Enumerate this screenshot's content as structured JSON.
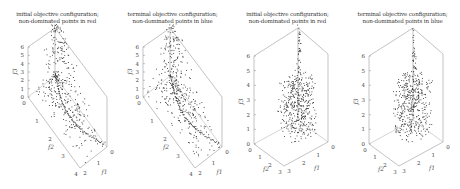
{
  "figure": {
    "panels": [
      {
        "title_line1": "initial objective configuration;",
        "title_line2": "non-dominated points in red",
        "shape": "cone",
        "xlim": [
          0,
          4
        ],
        "ylim": [
          0,
          2
        ],
        "zlim": [
          0,
          6
        ]
      },
      {
        "title_line1": "terminal objective configuration;",
        "title_line2": "non-dominated points in blue",
        "shape": "cone",
        "xlim": [
          0,
          4
        ],
        "ylim": [
          0,
          2
        ],
        "zlim": [
          0,
          6
        ]
      },
      {
        "title_line1": "initial objective configuration;",
        "title_line2": "non-dominated points in red",
        "shape": "block",
        "xlim": [
          0,
          3
        ],
        "ylim": [
          0,
          3
        ],
        "zlim": [
          0,
          6
        ]
      },
      {
        "title_line1": "terminal objective configuration;",
        "title_line2": "non-dominated points in blue",
        "shape": "block",
        "xlim": [
          0,
          3
        ],
        "ylim": [
          0,
          3
        ],
        "zlim": [
          0,
          6
        ]
      }
    ]
  },
  "chart_data": [
    {
      "type": "scatter",
      "title": "initial objective configuration; non-dominated points in red",
      "xlabel": "f2",
      "ylabel": "f1",
      "zlabel": "f3",
      "x_ticks": [
        "0",
        "1",
        "2",
        "3",
        "4"
      ],
      "y_ticks": [
        "0",
        "1",
        "2"
      ],
      "z_ticks": [
        "0",
        "1",
        "2",
        "3",
        "4",
        "5",
        "6"
      ],
      "xlim": [
        0,
        4
      ],
      "ylim": [
        0,
        2
      ],
      "zlim": [
        0,
        6
      ],
      "grid": false,
      "description": "3D point cloud in the shape of a cone/pyramid peaking near f3=6 at f1=f2=0, spreading to f2=4 and f1=2 at f3=0"
    },
    {
      "type": "scatter",
      "title": "terminal objective configuration; non-dominated points in blue",
      "xlabel": "f2",
      "ylabel": "f1",
      "zlabel": "f3",
      "x_ticks": [
        "0",
        "1",
        "2",
        "3",
        "4"
      ],
      "y_ticks": [
        "0",
        "1",
        "2"
      ],
      "z_ticks": [
        "0",
        "1",
        "2",
        "3",
        "4",
        "5",
        "6"
      ],
      "xlim": [
        0,
        4
      ],
      "ylim": [
        0,
        2
      ],
      "zlim": [
        0,
        6
      ],
      "grid": false,
      "description": "3D point cloud similar to panel 1, with a denser curved front along the f3=0 base"
    },
    {
      "type": "scatter",
      "title": "initial objective configuration; non-dominated points in red",
      "xlabel": "f2",
      "ylabel": "f1",
      "zlabel": "f3",
      "x_ticks": [
        "0",
        "1",
        "2",
        "3"
      ],
      "y_ticks": [
        "0",
        "1",
        "2",
        "3"
      ],
      "z_ticks": [
        "0",
        "1",
        "2",
        "3",
        "4",
        "5",
        "6"
      ],
      "xlim": [
        0,
        3
      ],
      "ylim": [
        0,
        3
      ],
      "zlim": [
        0,
        6
      ],
      "grid": false,
      "description": "3D point cloud concentrated in a block over f3 in [0,3], with a thin column rising to f3=6"
    },
    {
      "type": "scatter",
      "title": "terminal objective configuration; non-dominated points in blue",
      "xlabel": "f2",
      "ylabel": "f1",
      "zlabel": "f3",
      "x_ticks": [
        "0",
        "1",
        "2",
        "3"
      ],
      "y_ticks": [
        "0",
        "1",
        "2",
        "3"
      ],
      "z_ticks": [
        "0",
        "1",
        "2",
        "3",
        "4",
        "5",
        "6"
      ],
      "xlim": [
        0,
        3
      ],
      "ylim": [
        0,
        3
      ],
      "zlim": [
        0,
        6
      ],
      "grid": false,
      "description": "3D point cloud in a dense block over f3 in [0,3], with a sparse column rising toward f3=6"
    }
  ]
}
